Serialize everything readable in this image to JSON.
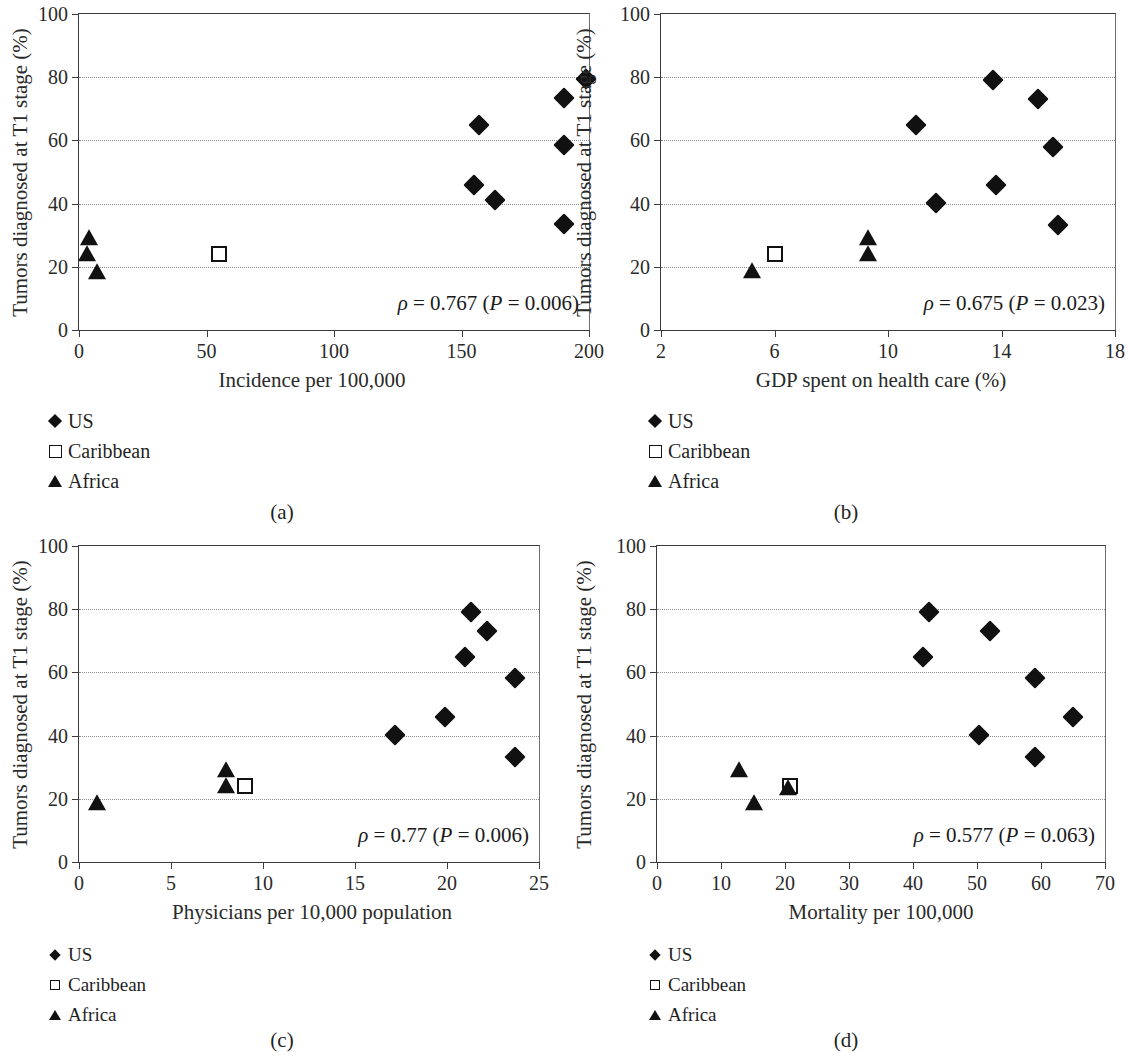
{
  "figure": {
    "legend_entries": [
      {
        "symbol": "filled-diamond",
        "label": "US"
      },
      {
        "symbol": "open-square",
        "label": "Caribbean"
      },
      {
        "symbol": "filled-triangle",
        "label": "Africa"
      }
    ],
    "shared_ylabel": "Tumors diagnosed at T1 stage (%)",
    "marker_color": "#111111",
    "grid_color": "#8a8a8a",
    "axis_color": "#3b3b3b"
  },
  "panels": [
    {
      "id": "a",
      "caption": "(a)"
    },
    {
      "id": "b",
      "caption": "(b)"
    },
    {
      "id": "c",
      "caption": "(c)"
    },
    {
      "id": "d",
      "caption": "(d)"
    }
  ],
  "chart_data": [
    {
      "type": "scatter",
      "panel": "(a)",
      "title": "",
      "xlabel": "Incidence per 100,000",
      "ylabel": "Tumors diagnosed at T1 stage (%)",
      "xlim": [
        0,
        200
      ],
      "ylim": [
        0,
        100
      ],
      "xticks": [
        0,
        50,
        100,
        150,
        200
      ],
      "yticks": [
        0,
        20,
        40,
        60,
        80,
        100
      ],
      "grid": "horizontal-dotted",
      "legend_position": "below-left",
      "annotation": "ρ = 0.767 (P = 0.006)",
      "annotation_rho": "0.767",
      "annotation_p": "0.006",
      "series": [
        {
          "name": "US",
          "marker": "filled-diamond",
          "points": [
            [
              157,
              65
            ],
            [
              155,
              46
            ],
            [
              163,
              41
            ],
            [
              190,
              73.5
            ],
            [
              190,
              58.5
            ],
            [
              190,
              33.5
            ],
            [
              199,
              79.5
            ]
          ]
        },
        {
          "name": "Caribbean",
          "marker": "open-square",
          "points": [
            [
              55,
              24
            ]
          ]
        },
        {
          "name": "Africa",
          "marker": "filled-triangle",
          "points": [
            [
              4,
              29
            ],
            [
              3,
              24
            ],
            [
              7,
              18.5
            ]
          ]
        }
      ]
    },
    {
      "type": "scatter",
      "panel": "(b)",
      "title": "",
      "xlabel": "GDP spent on health care (%)",
      "ylabel": "Tumors diagnosed at T1 stage (%)",
      "xlim": [
        2,
        18
      ],
      "ylim": [
        0,
        100
      ],
      "xticks": [
        2,
        6,
        10,
        14,
        18
      ],
      "yticks": [
        0,
        20,
        40,
        60,
        80,
        100
      ],
      "grid": "horizontal-dotted",
      "legend_position": "below-left",
      "annotation": "ρ = 0.675 (P = 0.023)",
      "annotation_rho": "0.675",
      "annotation_p": "0.023",
      "series": [
        {
          "name": "US",
          "marker": "filled-diamond",
          "points": [
            [
              11.0,
              65
            ],
            [
              11.7,
              40.3
            ],
            [
              13.7,
              79
            ],
            [
              13.8,
              46
            ],
            [
              15.3,
              73
            ],
            [
              15.8,
              58
            ],
            [
              16.0,
              33.3
            ]
          ]
        },
        {
          "name": "Caribbean",
          "marker": "open-square",
          "points": [
            [
              6.0,
              24
            ]
          ]
        },
        {
          "name": "Africa",
          "marker": "filled-triangle",
          "points": [
            [
              9.3,
              29
            ],
            [
              9.3,
              24
            ],
            [
              5.2,
              18.7
            ]
          ]
        }
      ]
    },
    {
      "type": "scatter",
      "panel": "(c)",
      "title": "",
      "xlabel": "Physicians per 10,000 population",
      "ylabel": "Tumors diagnosed at T1 stage (%)",
      "xlim": [
        0,
        25
      ],
      "ylim": [
        0,
        100
      ],
      "xticks": [
        0,
        5,
        10,
        15,
        20,
        25
      ],
      "yticks": [
        0,
        20,
        40,
        60,
        80,
        100
      ],
      "grid": "horizontal-dotted",
      "legend_position": "below-left",
      "annotation": "ρ = 0.77 (P = 0.006)",
      "annotation_rho": "0.77",
      "annotation_p": "0.006",
      "series": [
        {
          "name": "US",
          "marker": "filled-diamond",
          "points": [
            [
              21.3,
              79
            ],
            [
              22.2,
              73
            ],
            [
              21.0,
              65
            ],
            [
              23.7,
              58.3
            ],
            [
              19.9,
              46
            ],
            [
              17.2,
              40.3
            ],
            [
              23.7,
              33.3
            ]
          ]
        },
        {
          "name": "Caribbean",
          "marker": "open-square",
          "points": [
            [
              9.0,
              24
            ]
          ]
        },
        {
          "name": "Africa",
          "marker": "filled-triangle",
          "points": [
            [
              8.0,
              29
            ],
            [
              8.0,
              24
            ],
            [
              1.0,
              18.7
            ]
          ]
        }
      ]
    },
    {
      "type": "scatter",
      "panel": "(d)",
      "title": "",
      "xlabel": "Mortality per 100,000",
      "ylabel": "Tumors diagnosed at T1 stage (%)",
      "xlim": [
        0,
        70
      ],
      "ylim": [
        0,
        100
      ],
      "xticks": [
        0,
        10,
        20,
        30,
        40,
        50,
        60,
        70
      ],
      "yticks": [
        0,
        20,
        40,
        60,
        80,
        100
      ],
      "grid": "horizontal-dotted",
      "legend_position": "below-left",
      "annotation": "ρ = 0.577 (P = 0.063)",
      "annotation_rho": "0.577",
      "annotation_p": "0.063",
      "series": [
        {
          "name": "US",
          "marker": "filled-diamond",
          "points": [
            [
              42.5,
              79
            ],
            [
              41.5,
              65
            ],
            [
              52.0,
              73
            ],
            [
              59.0,
              58.3
            ],
            [
              65.0,
              46
            ],
            [
              50.3,
              40.3
            ],
            [
              59.0,
              33.3
            ]
          ]
        },
        {
          "name": "Caribbean",
          "marker": "open-square",
          "points": [
            [
              20.8,
              24
            ]
          ]
        },
        {
          "name": "Africa",
          "marker": "filled-triangle",
          "points": [
            [
              12.8,
              29
            ],
            [
              20.5,
              23.5
            ],
            [
              15.2,
              18.7
            ]
          ]
        }
      ]
    }
  ]
}
